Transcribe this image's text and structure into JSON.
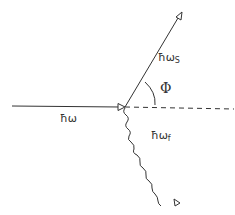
{
  "diagram": {
    "type": "scattering-diagram",
    "colors": {
      "stroke": "#333333",
      "background": "#ffffff"
    },
    "lines": [
      {
        "id": "incident",
        "style": "solid",
        "from": [
          12,
          106
        ],
        "to": [
          124,
          107
        ],
        "arrowhead": "at-end"
      },
      {
        "id": "reference-axis",
        "style": "dashed",
        "from": [
          124,
          107
        ],
        "to": [
          234,
          109
        ]
      },
      {
        "id": "scattered",
        "style": "solid",
        "from": [
          124,
          107
        ],
        "to": [
          180,
          14
        ],
        "arrowhead": "at-end"
      },
      {
        "id": "emitted-photon",
        "style": "wavy",
        "from": [
          124,
          107
        ],
        "to": [
          178,
          204
        ],
        "arrowhead": "at-end"
      }
    ],
    "labels": {
      "incident": {
        "base": "ħω",
        "sub": ""
      },
      "scattered": {
        "base": "ħω",
        "sub": "S"
      },
      "photon": {
        "base": "ħω",
        "sub": "f"
      },
      "angle": "Φ"
    }
  }
}
